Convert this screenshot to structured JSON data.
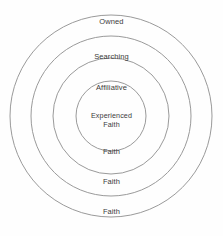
{
  "diagram": {
    "type": "concentric-circles",
    "title": "",
    "background_color": "#fefefe",
    "stroke_color": "#9a9a9a",
    "text_color": "#3b3b3b",
    "center": {
      "x": 111,
      "y": 116
    },
    "rings": [
      {
        "id": "ring-outer",
        "index": 1,
        "radius": 101,
        "top_label": "Owned",
        "bottom_label": "Faith"
      },
      {
        "id": "ring-second",
        "index": 2,
        "radius": 80,
        "top_label": "Searching",
        "bottom_label": "Faith"
      },
      {
        "id": "ring-third",
        "index": 3,
        "radius": 58,
        "top_label": "Affiliative",
        "bottom_label": "Faith"
      },
      {
        "id": "ring-core",
        "index": 4,
        "radius": 35,
        "top_label": "Experienced\nFaith",
        "bottom_label": ""
      }
    ],
    "labels": [
      {
        "name": "label-owned",
        "text": "Owned",
        "y": 17
      },
      {
        "name": "label-searching",
        "text": "Searching",
        "y": 52
      },
      {
        "name": "label-affiliative",
        "text": "Affiliative",
        "y": 83
      },
      {
        "name": "label-experienced-faith",
        "text": "Experienced\nFaith",
        "y": 112
      },
      {
        "name": "label-faith-third",
        "text": "Faith",
        "y": 147
      },
      {
        "name": "label-faith-second",
        "text": "Faith",
        "y": 177
      },
      {
        "name": "label-faith-outer",
        "text": "Faith",
        "y": 207
      }
    ]
  }
}
